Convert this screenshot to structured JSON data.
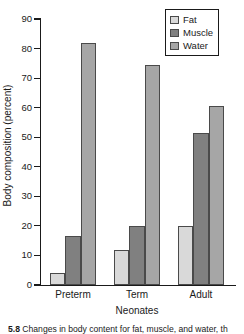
{
  "chart_data": {
    "type": "bar",
    "title": "",
    "xlabel": "Neonates",
    "ylabel": "Body composition (percent)",
    "categories": [
      "Preterm",
      "Term",
      "Adult"
    ],
    "series": [
      {
        "name": "Fat",
        "values": [
          4.0,
          11.7,
          19.8
        ],
        "color": "#d9d9d9"
      },
      {
        "name": "Muscle",
        "values": [
          16.7,
          19.8,
          51.4
        ],
        "color": "#808080"
      },
      {
        "name": "Water",
        "values": [
          82.0,
          74.3,
          60.5
        ],
        "color": "#a6a6a6"
      }
    ],
    "ylim": [
      0,
      90
    ],
    "yticks": [
      0,
      10,
      20,
      30,
      40,
      50,
      60,
      70,
      80,
      90
    ],
    "ytick_labels": [
      "0",
      "10",
      "20",
      "30",
      "40",
      "50",
      "60",
      "70",
      "80",
      "90"
    ],
    "grid": false,
    "legend_position": "top-right-inside",
    "bar_edge_color": "#4a4a4a",
    "axis_color": "#1a1a1a"
  },
  "legend": {
    "items": [
      {
        "label": "Fat"
      },
      {
        "label": "Muscle"
      },
      {
        "label": "Water"
      }
    ]
  },
  "caption": {
    "number": "5.8",
    "text": "Changes in body content for fat, muscle, and water, th"
  }
}
